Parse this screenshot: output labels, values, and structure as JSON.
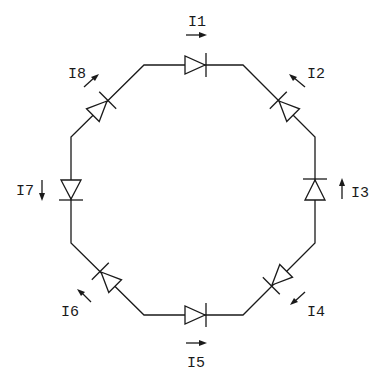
{
  "diagram": {
    "colors": {
      "ink": "#1a1a1a",
      "background": "#ffffff"
    },
    "currents": [
      {
        "id": "I1",
        "label": "I1",
        "position": "top",
        "arrow_direction": "right"
      },
      {
        "id": "I2",
        "label": "I2",
        "position": "top-right",
        "arrow_direction": "up-left"
      },
      {
        "id": "I3",
        "label": "I3",
        "position": "right",
        "arrow_direction": "up"
      },
      {
        "id": "I4",
        "label": "I4",
        "position": "bottom-right",
        "arrow_direction": "down-left"
      },
      {
        "id": "I5",
        "label": "I5",
        "position": "bottom",
        "arrow_direction": "right"
      },
      {
        "id": "I6",
        "label": "I6",
        "position": "bottom-left",
        "arrow_direction": "up-left"
      },
      {
        "id": "I7",
        "label": "I7",
        "position": "left",
        "arrow_direction": "down"
      },
      {
        "id": "I8",
        "label": "I8",
        "position": "top-left",
        "arrow_direction": "up-right"
      }
    ],
    "diodes": [
      {
        "id": "D-top",
        "edge": "top",
        "points_toward": "right"
      },
      {
        "id": "D-top-right",
        "edge": "top-right",
        "points_toward": "up-left"
      },
      {
        "id": "D-right",
        "edge": "right",
        "points_toward": "up"
      },
      {
        "id": "D-bottom-right",
        "edge": "bottom-right",
        "points_toward": "down-left"
      },
      {
        "id": "D-bottom",
        "edge": "bottom",
        "points_toward": "right"
      },
      {
        "id": "D-bottom-left",
        "edge": "bottom-left",
        "points_toward": "up-left"
      },
      {
        "id": "D-left",
        "edge": "left",
        "points_toward": "down"
      },
      {
        "id": "D-top-left",
        "edge": "top-left",
        "points_toward": "up-right"
      }
    ]
  }
}
